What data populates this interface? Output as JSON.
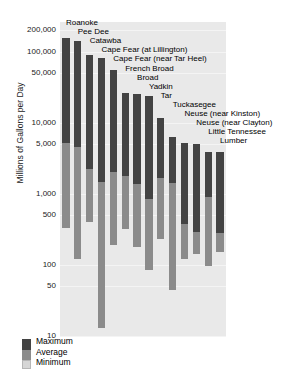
{
  "chart_data": {
    "type": "bar",
    "title": "",
    "subtitle": "",
    "xlabel": "",
    "ylabel": "Millions of Gallons per Day",
    "yscale": "log",
    "ylim": [
      10,
      260000
    ],
    "grid": true,
    "legend_position": "bottom-left",
    "ytick_labels": [
      "200,000",
      "100,000",
      "50,000",
      "10,000",
      "5,000",
      "1,000",
      "500",
      "100",
      "50",
      "10"
    ],
    "ytick_values": [
      200000,
      100000,
      50000,
      10000,
      5000,
      1000,
      500,
      100,
      50,
      10
    ],
    "categories": [
      "Roanoke",
      "Pee Dee",
      "Catawba",
      "Cape Fear (at Lillington)",
      "Cape Fear (near Tar Heel)",
      "French Broad",
      "Broad",
      "Yadkin",
      "Tar",
      "Tuckasegee",
      "Neuse (near Kinston)",
      "Neuse (near Clayton)",
      "Little Tennessee",
      "Lumber"
    ],
    "series": [
      {
        "name": "Maximum",
        "values": [
          155000,
          140000,
          88000,
          80000,
          55000,
          26000,
          25000,
          24000,
          11500,
          6200,
          5200,
          5000,
          3900,
          3900
        ]
      },
      {
        "name": "Average",
        "values": [
          5200,
          4600,
          2200,
          1450,
          2050,
          1750,
          1350,
          850,
          1650,
          1400,
          380,
          290,
          900,
          280
        ]
      },
      {
        "name": "Minimum",
        "values": [
          330,
          120,
          400,
          13,
          190,
          320,
          180,
          85,
          230,
          45,
          120,
          140,
          95,
          150
        ]
      }
    ],
    "bars": [
      {
        "label": "Roanoke",
        "max": 155000,
        "avg": 5200,
        "min": 330
      },
      {
        "label": "Pee Dee",
        "max": 140000,
        "avg": 4600,
        "min": 120
      },
      {
        "label": "Catawba",
        "max": 88000,
        "avg": 2200,
        "min": 400
      },
      {
        "label": "Cape Fear (at Lillington)",
        "max": 80000,
        "avg": 1450,
        "min": 13
      },
      {
        "label": "Cape Fear (near Tar Heel)",
        "max": 55000,
        "avg": 2050,
        "min": 190
      },
      {
        "label": "French Broad",
        "max": 26000,
        "avg": 1750,
        "min": 320
      },
      {
        "label": "Broad",
        "max": 25000,
        "avg": 1350,
        "min": 180
      },
      {
        "label": "Yadkin",
        "max": 24000,
        "avg": 850,
        "min": 85
      },
      {
        "label": "Tar",
        "max": 11500,
        "avg": 1650,
        "min": 230
      },
      {
        "label": "Tuckasegee",
        "max": 6200,
        "avg": 1400,
        "min": 45
      },
      {
        "label": "Neuse (near Kinston)",
        "max": 5200,
        "avg": 380,
        "min": 120
      },
      {
        "label": "Neuse (near Clayton)",
        "max": 5000,
        "avg": 290,
        "min": 140
      },
      {
        "label": "Little Tennessee",
        "max": 3900,
        "avg": 900,
        "min": 95
      },
      {
        "label": "Lumber",
        "max": 3900,
        "avg": 280,
        "min": 150
      }
    ],
    "colors": {
      "maximum": "#434343",
      "average": "#8b8b8b",
      "minimum": "#d6d6d6",
      "plot_background": "#e9e9e9",
      "page_background": "#ffffff",
      "text": "#000000"
    }
  },
  "legend": {
    "items": [
      {
        "label": "Maximum",
        "color": "#434343"
      },
      {
        "label": "Average",
        "color": "#8b8b8b"
      },
      {
        "label": "Minimum",
        "color": "#d6d6d6"
      }
    ]
  }
}
